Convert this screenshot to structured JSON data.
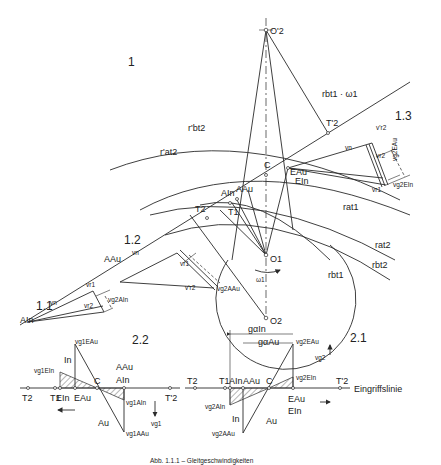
{
  "figure": {
    "caption_partial": "Abb. 1.1.1 – Gleitgeschwindigkeiten",
    "regions": {
      "r1": "1",
      "r11": "1.1",
      "r12": "1.2",
      "r13": "1.3",
      "r22": "2.2",
      "r21": "2.1"
    },
    "centers": {
      "O2p": "O'2",
      "O1": "O1",
      "O2": "O2",
      "omega1": "ω1"
    },
    "radii": {
      "rbt2p": "r'bt2",
      "rat2p": "r'at2",
      "rat1": "rat1",
      "rbt1": "rbt1",
      "rat2": "rat2",
      "rbt2": "rbt2",
      "rbt1w": "rbt1 · ω1"
    },
    "points": {
      "T2p": "T'2",
      "T2": "T2",
      "T1": "T1",
      "C": "C",
      "AIn": "AIn",
      "AAu": "AAu",
      "EAu": "EAu",
      "EIn": "EIn"
    },
    "vectors": {
      "vn": "vn",
      "vr1": "vr1",
      "vr2": "vr2",
      "vr2p": "v'r2",
      "vg2AIn": "vg2AIn",
      "vg2AAu": "vg2AAu",
      "vg2EAu": "vg2EAu",
      "vg2EIn": "vg2EIn"
    },
    "diagram22": {
      "T2": "T2",
      "T1": "T1",
      "EIn": "EIn",
      "EAu": "EAu",
      "C": "C",
      "AAu": "AAu",
      "AIn": "AIn",
      "T2p": "T'2",
      "In": "In",
      "Au": "Au",
      "vg1EAu": "vg1EAu",
      "vg1EIn": "vg1EIn",
      "vg1AIn": "vg1AIn",
      "vg1AAu": "vg1AAu",
      "vg1": "vg1"
    },
    "diagram21": {
      "T2": "T2",
      "T1": "T1",
      "AIn": "AIn",
      "AAu": "AAu",
      "C": "C",
      "EAu": "EAu",
      "EIn": "EIn",
      "T2p": "T'2",
      "In": "In",
      "Au": "Au",
      "gaIn": "gαIn",
      "gaAu": "gαAu",
      "vg2EAu": "vg2EAu",
      "vg2EIn": "vg2EIn",
      "vg2AIn": "vg2AIn",
      "vg2AAu": "vg2AAu",
      "vg2": "vg2",
      "line": "Eingriffslinie"
    }
  }
}
